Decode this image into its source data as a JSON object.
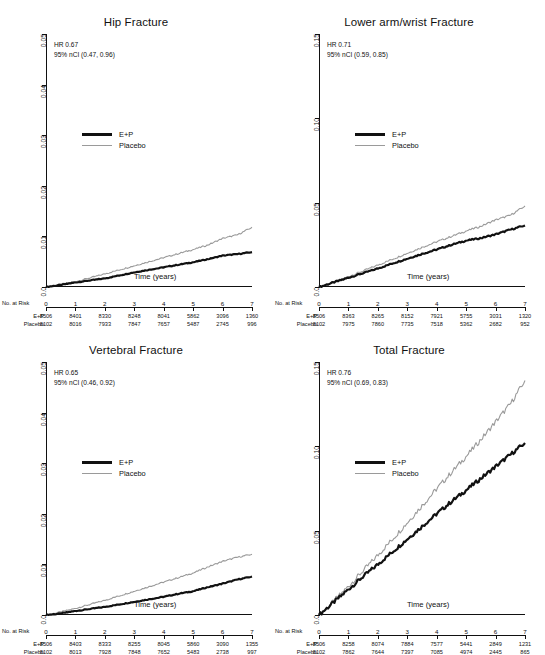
{
  "figure": {
    "legend_labels": {
      "treatment": "E+P",
      "control": "Placebo"
    },
    "xlabel": "Time (years)",
    "risk_header": "No. at Risk",
    "colors": {
      "treatment": "#111111",
      "control": "#9a9a9a",
      "axis": "#111111"
    }
  },
  "chart_data": [
    {
      "type": "line",
      "panel": "top-left",
      "title": "Hip Fracture",
      "xlabel": "Time (years)",
      "ylabel": "",
      "hr_label": "HR",
      "hr_value": "0.67",
      "ci_label": "95% nCI",
      "ci_value": "(0.47, 0.96)",
      "annotation_line1": "HR   0.67",
      "annotation_line2": "95% nCI  (0.47, 0.96)",
      "xlim": [
        0,
        7
      ],
      "ylim": [
        0,
        0.05
      ],
      "xticks": [
        0,
        1,
        2,
        3,
        4,
        5,
        6,
        7
      ],
      "xtick_labels": [
        "0",
        "1",
        "2",
        "3",
        "4",
        "5",
        "6",
        "7"
      ],
      "yticks": [
        0,
        0.01,
        0.02,
        0.03,
        0.04,
        0.05
      ],
      "ytick_labels": [
        "0.0",
        "0.01",
        "0.02",
        "0.03",
        "0.04",
        "0.05"
      ],
      "grid": false,
      "legend_position": "middle-left",
      "series": [
        {
          "name": "E+P",
          "x": [
            0,
            0.5,
            1,
            1.5,
            2,
            2.5,
            3,
            3.5,
            4,
            4.5,
            5,
            5.5,
            6,
            6.5,
            7
          ],
          "values": [
            0,
            0.0004,
            0.0009,
            0.0013,
            0.0017,
            0.0023,
            0.0029,
            0.0034,
            0.0039,
            0.0044,
            0.0049,
            0.0055,
            0.0062,
            0.0065,
            0.0069
          ]
        },
        {
          "name": "Placebo",
          "x": [
            0,
            0.5,
            1,
            1.5,
            2,
            2.5,
            3,
            3.5,
            4,
            4.5,
            5,
            5.5,
            6,
            6.5,
            7
          ],
          "values": [
            0,
            0.0005,
            0.0011,
            0.0018,
            0.0026,
            0.0034,
            0.0042,
            0.005,
            0.0058,
            0.0066,
            0.0074,
            0.0083,
            0.0096,
            0.0103,
            0.0118
          ]
        }
      ],
      "risk_table": {
        "row_labels": [
          "E+P",
          "Placebo"
        ],
        "times": [
          "0",
          "1",
          "2",
          "3",
          "4",
          "5",
          "6",
          "7"
        ],
        "rows": [
          [
            "8506",
            "8401",
            "8330",
            "8248",
            "8041",
            "5862",
            "3096",
            "1360"
          ],
          [
            "8102",
            "8016",
            "7933",
            "7847",
            "7657",
            "5487",
            "2745",
            "996"
          ]
        ]
      }
    },
    {
      "type": "line",
      "panel": "top-right",
      "title": "Lower arm/wrist Fracture",
      "xlabel": "Time (years)",
      "ylabel": "",
      "hr_label": "HR",
      "hr_value": "0.71",
      "ci_label": "95% nCI",
      "ci_value": "(0.59, 0.85)",
      "annotation_line1": "HR   0.71",
      "annotation_line2": "95% nCI  (0.59, 0.85)",
      "xlim": [
        0,
        7
      ],
      "ylim": [
        0,
        0.15
      ],
      "xticks": [
        0,
        1,
        2,
        3,
        4,
        5,
        6,
        7
      ],
      "xtick_labels": [
        "0",
        "1",
        "2",
        "3",
        "4",
        "5",
        "6",
        "7"
      ],
      "yticks": [
        0,
        0.05,
        0.1,
        0.15
      ],
      "ytick_labels": [
        "0.0",
        "0.05",
        "0.10",
        "0.15"
      ],
      "grid": false,
      "legend_position": "middle-left",
      "series": [
        {
          "name": "E+P",
          "x": [
            0,
            0.5,
            1,
            1.5,
            2,
            2.5,
            3,
            3.5,
            4,
            4.5,
            5,
            5.5,
            6,
            6.5,
            7
          ],
          "values": [
            0,
            0.0027,
            0.0055,
            0.0082,
            0.011,
            0.014,
            0.0168,
            0.0196,
            0.0222,
            0.025,
            0.0275,
            0.029,
            0.0312,
            0.034,
            0.0365
          ]
        },
        {
          "name": "Placebo",
          "x": [
            0,
            0.5,
            1,
            1.5,
            2,
            2.5,
            3,
            3.5,
            4,
            4.5,
            5,
            5.5,
            6,
            6.5,
            7
          ],
          "values": [
            0,
            0.003,
            0.0062,
            0.0095,
            0.013,
            0.0165,
            0.02,
            0.0235,
            0.0268,
            0.03,
            0.0332,
            0.036,
            0.0398,
            0.0425,
            0.048
          ]
        }
      ],
      "risk_table": {
        "row_labels": [
          "E+P",
          "Placebo"
        ],
        "times": [
          "0",
          "1",
          "2",
          "3",
          "4",
          "5",
          "6",
          "7"
        ],
        "rows": [
          [
            "8506",
            "8363",
            "8265",
            "8152",
            "7921",
            "5755",
            "3031",
            "1320"
          ],
          [
            "8102",
            "7975",
            "7860",
            "7735",
            "7518",
            "5362",
            "2682",
            "952"
          ]
        ]
      }
    },
    {
      "type": "line",
      "panel": "bottom-left",
      "title": "Vertebral Fracture",
      "xlabel": "Time (years)",
      "ylabel": "",
      "hr_label": "HR",
      "hr_value": "0.65",
      "ci_label": "95% nCI",
      "ci_value": "(0.46, 0.92)",
      "annotation_line1": "HR   0.65",
      "annotation_line2": "95% nCI  (0.46, 0.92)",
      "xlim": [
        0,
        7
      ],
      "ylim": [
        0,
        0.05
      ],
      "xticks": [
        0,
        1,
        2,
        3,
        4,
        5,
        6,
        7
      ],
      "xtick_labels": [
        "0",
        "1",
        "2",
        "3",
        "4",
        "5",
        "6",
        "7"
      ],
      "yticks": [
        0,
        0.01,
        0.02,
        0.03,
        0.04,
        0.05
      ],
      "ytick_labels": [
        "0.0",
        "0.01",
        "0.02",
        "0.03",
        "0.04",
        "0.05"
      ],
      "grid": false,
      "legend_position": "middle-left",
      "series": [
        {
          "name": "E+P",
          "x": [
            0,
            0.5,
            1,
            1.5,
            2,
            2.5,
            3,
            3.5,
            4,
            4.5,
            5,
            5.5,
            6,
            6.5,
            7
          ],
          "values": [
            0,
            0.0003,
            0.0008,
            0.0012,
            0.0016,
            0.0021,
            0.0026,
            0.0031,
            0.0036,
            0.0042,
            0.0047,
            0.0055,
            0.0062,
            0.007,
            0.0076
          ]
        },
        {
          "name": "Placebo",
          "x": [
            0,
            0.5,
            1,
            1.5,
            2,
            2.5,
            3,
            3.5,
            4,
            4.5,
            5,
            5.5,
            6,
            6.5,
            7
          ],
          "values": [
            0,
            0.0006,
            0.0013,
            0.0021,
            0.0029,
            0.0038,
            0.0047,
            0.0056,
            0.0065,
            0.0074,
            0.0083,
            0.0095,
            0.0106,
            0.0114,
            0.012
          ]
        }
      ],
      "risk_table": {
        "row_labels": [
          "E+P",
          "Placebo"
        ],
        "times": [
          "0",
          "1",
          "2",
          "3",
          "4",
          "5",
          "6",
          "7"
        ],
        "rows": [
          [
            "8506",
            "8403",
            "8333",
            "8255",
            "8045",
            "5860",
            "3090",
            "1355"
          ],
          [
            "8102",
            "8013",
            "7928",
            "7848",
            "7652",
            "5483",
            "2738",
            "997"
          ]
        ]
      }
    },
    {
      "type": "line",
      "panel": "bottom-right",
      "title": "Total Fracture",
      "xlabel": "Time (years)",
      "ylabel": "",
      "hr_label": "HR",
      "hr_value": "0.76",
      "ci_label": "95% nCI",
      "ci_value": "(0.69, 0.83)",
      "annotation_line1": "HR   0.76",
      "annotation_line2": "95% nCI  (0.69, 0.83)",
      "xlim": [
        0,
        7
      ],
      "ylim": [
        0,
        0.15
      ],
      "xticks": [
        0,
        1,
        2,
        3,
        4,
        5,
        6,
        7
      ],
      "xtick_labels": [
        "0",
        "1",
        "2",
        "3",
        "4",
        "5",
        "6",
        "7"
      ],
      "yticks": [
        0,
        0.05,
        0.1,
        0.15
      ],
      "ytick_labels": [
        "0.0",
        "0.05",
        "0.10",
        "0.15"
      ],
      "grid": false,
      "legend_position": "middle-left",
      "series": [
        {
          "name": "E+P",
          "x": [
            0,
            0.5,
            1,
            1.5,
            2,
            2.5,
            3,
            3.5,
            4,
            4.5,
            5,
            5.5,
            6,
            6.5,
            7
          ],
          "values": [
            0,
            0.0075,
            0.0152,
            0.0228,
            0.03,
            0.0375,
            0.045,
            0.0525,
            0.06,
            0.0672,
            0.074,
            0.081,
            0.088,
            0.095,
            0.102
          ]
        },
        {
          "name": "Placebo",
          "x": [
            0,
            0.5,
            1,
            1.5,
            2,
            2.5,
            3,
            3.5,
            4,
            4.5,
            5,
            5.5,
            6,
            6.5,
            7
          ],
          "values": [
            0,
            0.0082,
            0.017,
            0.0262,
            0.0355,
            0.045,
            0.0548,
            0.0648,
            0.0748,
            0.0845,
            0.094,
            0.104,
            0.1145,
            0.125,
            0.139
          ]
        }
      ],
      "risk_table": {
        "row_labels": [
          "E+P",
          "Placebo"
        ],
        "times": [
          "0",
          "1",
          "2",
          "3",
          "4",
          "5",
          "6",
          "7"
        ],
        "rows": [
          [
            "8506",
            "8258",
            "8074",
            "7884",
            "7577",
            "5441",
            "2849",
            "1231"
          ],
          [
            "8102",
            "7862",
            "7644",
            "7397",
            "7085",
            "4974",
            "2445",
            "865"
          ]
        ]
      }
    }
  ]
}
